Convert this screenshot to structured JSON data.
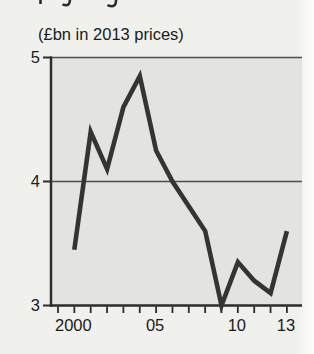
{
  "subtitle": "(£bn in 2013 prices)",
  "colors": {
    "page_bg": "#f0f0ec",
    "plot_bg": "#e3e3df",
    "axis": "#2c2c2c",
    "grid": "#4d4d4d",
    "line": "#343434",
    "text": "#1b1b1b"
  },
  "chart_data": {
    "type": "line",
    "title": "(£bn in 2013 prices)",
    "x": [
      2000,
      2001,
      2002,
      2003,
      2004,
      2005,
      2006,
      2007,
      2008,
      2009,
      2010,
      2011,
      2012,
      2013
    ],
    "values": [
      3.45,
      4.4,
      4.1,
      4.6,
      4.85,
      4.25,
      4.0,
      3.8,
      3.6,
      3.0,
      3.35,
      3.2,
      3.1,
      3.6
    ],
    "xlabel": "",
    "ylabel": "",
    "ylim": [
      3,
      5
    ],
    "yticks": [
      5,
      4,
      3
    ],
    "x_minor_ticks": [
      1999,
      2000,
      2001,
      2002,
      2003,
      2004,
      2005,
      2006,
      2007,
      2008,
      2009,
      2010,
      2011,
      2012,
      2013
    ],
    "x_tick_labels": [
      {
        "x": 2000,
        "label": "2000"
      },
      {
        "x": 2005,
        "label": "05"
      },
      {
        "x": 2010,
        "label": "10"
      },
      {
        "x": 2013,
        "label": "13"
      }
    ],
    "gridline_y": 4,
    "grid": "single-horizontal-line-at-4",
    "legend": "none"
  }
}
